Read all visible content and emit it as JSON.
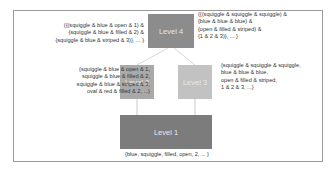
{
  "diagram": {
    "levels": [
      {
        "id": "level4",
        "label": "Level 4",
        "color": "#8c8c8c"
      },
      {
        "id": "level2",
        "label": "Level 2",
        "color": "#a9a9a9"
      },
      {
        "id": "level3",
        "label": "Level 3",
        "color": "#c2c2c2"
      },
      {
        "id": "level1",
        "label": "Level 1",
        "color": "#7c7c7c"
      }
    ],
    "annotations": {
      "level4_left": "({(squiggle & blue & open & 1) &\n{squiggle & blue & filled & 2) &\n{squiggle & blue & striped & 3)}, ... }",
      "level4_right": "({(squiggle & squiggle & squiggle) &\n{blue & blue & blue) &\n{open & filled & striped) &\n{1 & 2 & 3)}, ... }",
      "level2": "{squiggle & blue & open & 1,\nsquiggle & blue & filled & 2,\nsquiggle & blue & striped & 3,\noval & red & filled & 2, ...}",
      "level3": "{squiggle & squiggle & squiggle,\nblue & blue & blue,\nopen & filled & striped,\n1 & 2 & 3, ...}",
      "level1": "{blue, squiggle, filled, open, 2, ... }"
    },
    "edges": [
      {
        "from": "level1",
        "to": "level2"
      },
      {
        "from": "level1",
        "to": "level3"
      },
      {
        "from": "level2",
        "to": "level4"
      },
      {
        "from": "level3",
        "to": "level4"
      }
    ]
  }
}
